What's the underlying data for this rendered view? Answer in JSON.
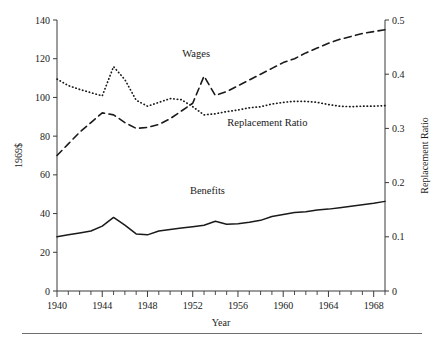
{
  "figure": {
    "name": "wages-benefits-replacement-ratio-chart",
    "footer_rule": true
  },
  "chart_data": {
    "type": "line",
    "title": "",
    "xlabel": "Year",
    "ylabel": "1969$",
    "y2label": "Replacement Ratio",
    "xlim": [
      1940,
      1969
    ],
    "ylim": [
      0,
      140
    ],
    "y2lim": [
      0,
      0.5
    ],
    "grid": false,
    "legend_position": "inline-annotations",
    "x_ticks_major": [
      1940,
      1944,
      1948,
      1952,
      1956,
      1960,
      1964,
      1968
    ],
    "x_tick_labels": [
      "1940",
      "1944",
      "1948",
      "1952",
      "1956",
      "1960",
      "1964",
      "1968"
    ],
    "x_ticks_minor_step": 1,
    "y_ticks": [
      0,
      20,
      40,
      60,
      80,
      100,
      120,
      140
    ],
    "y_tick_labels": [
      "0",
      "20",
      "40",
      "60",
      "80",
      "100",
      "120",
      "140"
    ],
    "y2_ticks": [
      0,
      0.1,
      0.2,
      0.3,
      0.4,
      0.5
    ],
    "y2_tick_labels": [
      "0",
      "0.1",
      "0.2",
      "0.3",
      "0.4",
      "0.5"
    ],
    "x": [
      1940,
      1941,
      1942,
      1943,
      1944,
      1945,
      1946,
      1947,
      1948,
      1949,
      1950,
      1951,
      1952,
      1953,
      1954,
      1955,
      1956,
      1957,
      1958,
      1959,
      1960,
      1961,
      1962,
      1963,
      1964,
      1965,
      1966,
      1967,
      1968,
      1969
    ],
    "series": [
      {
        "name": "Wages",
        "axis": "left",
        "units": "1969$",
        "style": "dashed",
        "label_x": 1952.3,
        "label_y": 121,
        "values": [
          70,
          76,
          82,
          87,
          92,
          91,
          87,
          84,
          84.5,
          86,
          89,
          93,
          97,
          111,
          101,
          103,
          106,
          109,
          112,
          115,
          118,
          120,
          123,
          125.5,
          128,
          130,
          131.5,
          133,
          134,
          135
        ]
      },
      {
        "name": "Benefits",
        "axis": "left",
        "units": "1969$",
        "style": "solid",
        "label_x": 1953.3,
        "label_y": 50,
        "values": [
          28,
          29,
          30,
          31,
          33.5,
          38,
          34,
          29.5,
          29,
          31,
          31.8,
          32.5,
          33.2,
          34,
          36,
          34.5,
          34.8,
          35.5,
          36.5,
          38.5,
          39.5,
          40.5,
          41,
          41.8,
          42.3,
          43,
          43.8,
          44.5,
          45.3,
          46.3
        ]
      },
      {
        "name": "Replacement Ratio",
        "axis": "right",
        "units": "ratio",
        "style": "dotted",
        "label_x": 1958.6,
        "label_y": 0.305,
        "values": [
          0.391,
          0.379,
          0.372,
          0.366,
          0.36,
          0.414,
          0.39,
          0.352,
          0.341,
          0.348,
          0.355,
          0.353,
          0.34,
          0.325,
          0.327,
          0.331,
          0.334,
          0.338,
          0.34,
          0.345,
          0.348,
          0.35,
          0.35,
          0.348,
          0.344,
          0.341,
          0.34,
          0.341,
          0.341,
          0.342
        ]
      }
    ]
  }
}
